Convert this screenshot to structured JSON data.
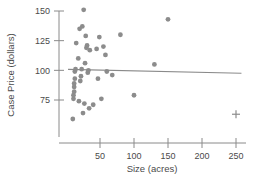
{
  "chart_data": {
    "type": "scatter",
    "title": "",
    "xlabel": "Size (acres)",
    "ylabel": "Case Price (dollars)",
    "xlim": [
      0,
      258
    ],
    "ylim": [
      55,
      157
    ],
    "xticks": [
      50,
      100,
      150,
      200,
      250
    ],
    "yticks": [
      75,
      100,
      125,
      150
    ],
    "grid": false,
    "legend": null,
    "point_color": "#8c8c8c",
    "line_color": "#8a8a8a",
    "axis_color": "#8a8a8a",
    "marker": "circle",
    "points": [
      {
        "x": 10,
        "y": 59
      },
      {
        "x": 11,
        "y": 76
      },
      {
        "x": 11,
        "y": 79
      },
      {
        "x": 12,
        "y": 82
      },
      {
        "x": 12,
        "y": 86
      },
      {
        "x": 12,
        "y": 89
      },
      {
        "x": 13,
        "y": 93
      },
      {
        "x": 13,
        "y": 99
      },
      {
        "x": 14,
        "y": 101
      },
      {
        "x": 15,
        "y": 123
      },
      {
        "x": 18,
        "y": 110
      },
      {
        "x": 19,
        "y": 74
      },
      {
        "x": 20,
        "y": 135
      },
      {
        "x": 21,
        "y": 91
      },
      {
        "x": 22,
        "y": 95
      },
      {
        "x": 23,
        "y": 101
      },
      {
        "x": 24,
        "y": 137
      },
      {
        "x": 25,
        "y": 64
      },
      {
        "x": 26,
        "y": 151
      },
      {
        "x": 27,
        "y": 72
      },
      {
        "x": 28,
        "y": 106
      },
      {
        "x": 29,
        "y": 129
      },
      {
        "x": 30,
        "y": 119
      },
      {
        "x": 31,
        "y": 121
      },
      {
        "x": 32,
        "y": 98
      },
      {
        "x": 33,
        "y": 100
      },
      {
        "x": 34,
        "y": 68
      },
      {
        "x": 35,
        "y": 117
      },
      {
        "x": 40,
        "y": 71
      },
      {
        "x": 45,
        "y": 118
      },
      {
        "x": 47,
        "y": 93
      },
      {
        "x": 49,
        "y": 128
      },
      {
        "x": 52,
        "y": 76
      },
      {
        "x": 55,
        "y": 120
      },
      {
        "x": 58,
        "y": 113
      },
      {
        "x": 60,
        "y": 99
      },
      {
        "x": 68,
        "y": 96
      },
      {
        "x": 80,
        "y": 130
      },
      {
        "x": 100,
        "y": 79
      },
      {
        "x": 130,
        "y": 105
      },
      {
        "x": 150,
        "y": 143
      }
    ],
    "outlier_markers": [
      {
        "x": 250,
        "y": 63,
        "marker": "plus"
      }
    ],
    "trend_line": {
      "type": "linear-fit",
      "x_start": 3,
      "y_start": 100.8,
      "x_end": 258,
      "y_end": 97.6
    }
  }
}
